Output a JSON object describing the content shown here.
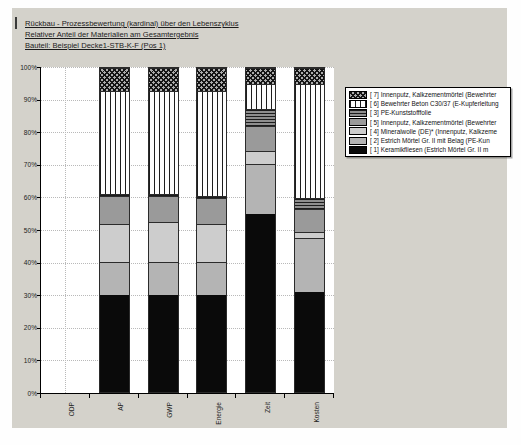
{
  "page": {
    "background": "#fefefe",
    "panel_background": "#d4d2cb"
  },
  "titles": {
    "line1": "Rückbau - Prozessbewertung (kardinal)  über den Lebenszyklus",
    "line2": "Relativer Anteil der Materialien am Gesamtergebnis",
    "line3": "Bauteil: Beispiel Decke1-STB-K-F (Pos 1)"
  },
  "chart_data": {
    "type": "bar",
    "subtype": "stacked-100-percent",
    "title": "",
    "xlabel": "",
    "ylabel": "",
    "ylim": [
      0,
      100
    ],
    "grid": "dotted",
    "legend_position": "right",
    "y_ticks": [
      "0%",
      "10%",
      "20%",
      "30%",
      "40%",
      "50%",
      "60%",
      "70%",
      "80%",
      "90%",
      "100%"
    ],
    "categories": [
      "ODP",
      "AP",
      "GWP",
      "Energie",
      "Zeit",
      "Kosten"
    ],
    "series": [
      {
        "id": 1,
        "name": "[ 1] Keramikfliesen (Estrich Mörtel Gr. II m",
        "pattern": "solid",
        "color": "#0a0a0a",
        "values": [
          0,
          30,
          30,
          30,
          55,
          31
        ]
      },
      {
        "id": 2,
        "name": "[ 2] Estrich Mörtel Gr. II mit Belag (PE-Kun",
        "pattern": "solid",
        "color": "#b4b4b4",
        "values": [
          0,
          10,
          10,
          10,
          15.5,
          16.5
        ]
      },
      {
        "id": 4,
        "name": "[ 4] Mineralwolle (DE)* (Innenputz, Kalkzeme",
        "pattern": "solid",
        "color": "#cdcdcd",
        "values": [
          0,
          12,
          12.5,
          12,
          4,
          2
        ]
      },
      {
        "id": 5,
        "name": "[ 5] Innenputz, Kalkzementmörtel (Bewehrter",
        "pattern": "solid",
        "color": "#9a9a9a",
        "values": [
          0,
          8.5,
          8,
          8,
          7.5,
          7
        ]
      },
      {
        "id": 3,
        "name": "[ 3] PE-Kunststofffolie",
        "pattern": "hlines",
        "color": "#8f8f8f",
        "values": [
          0,
          0.5,
          0.5,
          0.5,
          5.5,
          3.5
        ]
      },
      {
        "id": 6,
        "name": "[ 6] Bewehrter Beton C30/37 (E-Kupferleitung",
        "pattern": "vlines",
        "color": "#fdfdfd",
        "values": [
          0,
          32,
          32,
          32.5,
          7.5,
          35
        ]
      },
      {
        "id": 7,
        "name": "[ 7] Innenputz, Kalkzementmörtel (Bewehrter",
        "pattern": "cross",
        "color": "#adadad",
        "values": [
          0,
          7,
          7,
          7,
          5,
          5
        ]
      }
    ],
    "legend_order": [
      7,
      6,
      3,
      5,
      4,
      2,
      1
    ]
  }
}
